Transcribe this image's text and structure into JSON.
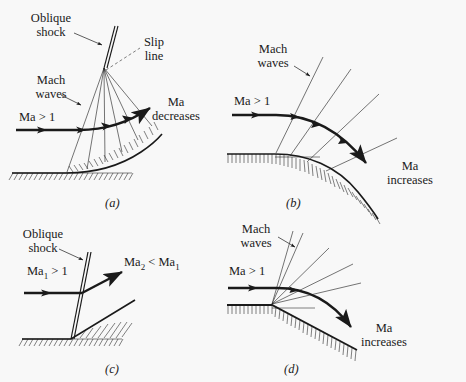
{
  "figure": {
    "kind": "supersonic-flow-diagram",
    "background_color": "#f8f8f8",
    "line_color": "#1a1a1a",
    "panels": [
      {
        "id": "a",
        "letter": "(a)",
        "description": "Gradual concave turn: compression Mach waves coalesce into an oblique shock with a slip line; flow Mach number decreases",
        "labels": {
          "oblique_shock": "Oblique\nshock",
          "slip_line": "Slip\nline",
          "mach_waves": "Mach\nwaves",
          "inflow": "Ma > 1",
          "outflow": "Ma\ndecreases"
        }
      },
      {
        "id": "b",
        "letter": "(b)",
        "description": "Gradual convex turn: diverging expansion Mach waves; flow Mach number increases",
        "labels": {
          "mach_waves": "Mach\nwaves",
          "inflow": "Ma > 1",
          "outflow": "Ma\nincreases"
        }
      },
      {
        "id": "c",
        "letter": "(c)",
        "description": "Sharp concave corner: single attached oblique shock turns the flow; downstream Mach number is lower",
        "labels": {
          "oblique_shock": "Oblique\nshock",
          "inflow_html": "Ma<sub>1</sub> > 1",
          "outflow_html": "Ma<sub>2</sub> < Ma<sub>1</sub>"
        }
      },
      {
        "id": "d",
        "letter": "(d)",
        "description": "Sharp convex corner: centered Prandtl-Meyer expansion fan of Mach waves; flow Mach number increases",
        "labels": {
          "mach_waves": "Mach\nwaves",
          "inflow": "Ma > 1",
          "outflow": "Ma\nincreases"
        }
      }
    ]
  }
}
